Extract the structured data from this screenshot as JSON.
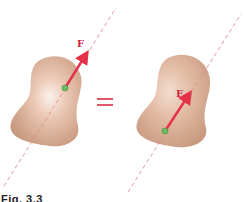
{
  "figure": {
    "caption": "Fig. 3.3",
    "left": {
      "force_label": "F",
      "line_of_action": {
        "x1": 4,
        "y1": 186,
        "x2": 116,
        "y2": 8
      },
      "point_of_application": {
        "x": 65,
        "y": 88
      },
      "arrow_tip": {
        "x": 88,
        "y": 51
      }
    },
    "equals_sign": "=",
    "right": {
      "force_label": "F",
      "line_of_action": {
        "x1": 128,
        "y1": 192,
        "x2": 241,
        "y2": 14
      },
      "point_of_application": {
        "x": 165,
        "y": 131
      },
      "arrow_tip": {
        "x": 191,
        "y": 92
      }
    },
    "colors": {
      "force_arrow": "#e5304a",
      "dashed_line": "#e58a96",
      "body_fill": "#d9b19a",
      "body_highlight": "#f7ece4",
      "point": "#6dbb5e",
      "equals": "#e0566a",
      "label": "#c8233c"
    }
  }
}
